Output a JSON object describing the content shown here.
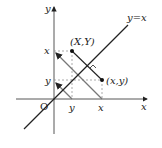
{
  "diagram": {
    "title": "",
    "axes": {
      "x_label": "x",
      "y_label": "y",
      "origin_label": "O"
    },
    "line": {
      "label": "y=x"
    },
    "points": [
      {
        "label": "(X,Y)"
      },
      {
        "label": "(x,y)"
      }
    ],
    "ticks": {
      "x_axis": [
        "y",
        "x"
      ],
      "y_axis": [
        "x",
        "y"
      ]
    },
    "colors": {
      "ink": "#222222",
      "dashed": "#888888",
      "grey_line": "#777777"
    }
  }
}
